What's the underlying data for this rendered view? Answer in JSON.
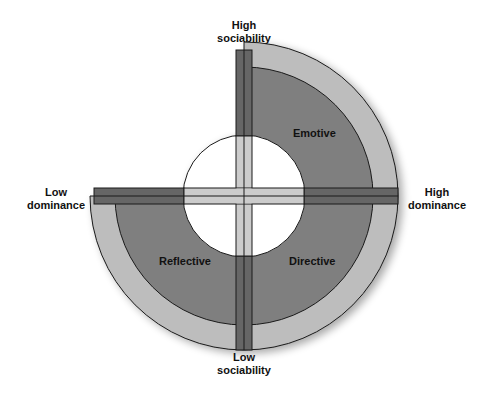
{
  "diagram": {
    "axes": {
      "top": [
        "High",
        "sociability"
      ],
      "bottom": [
        "Low",
        "sociability"
      ],
      "left": [
        "Low",
        "dominance"
      ],
      "right": [
        "High",
        "dominance"
      ]
    },
    "quadrants": {
      "top_right": "Emotive",
      "bottom_right": "Directive",
      "bottom_left": "Reflective",
      "top_left": ""
    },
    "colors": {
      "outer_ring": "#bdbdbd",
      "main_band": "#7f7f7f",
      "axis_bar_dark": "#666666",
      "axis_bar_light": "#cccccc",
      "hole": "#ffffff",
      "outline": "#1a1a1a"
    }
  }
}
